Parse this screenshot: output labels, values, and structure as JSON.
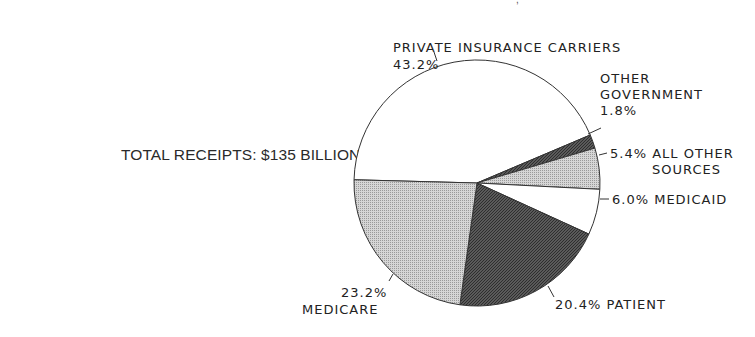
{
  "chart_data": {
    "type": "pie",
    "title": "",
    "annotation": "TOTAL RECEIPTS: $135 BILLION",
    "slices": [
      {
        "name": "PRIVATE INSURANCE CARRIERS",
        "value": 43.2,
        "label": "43.2%",
        "fill": "white"
      },
      {
        "name": "OTHER GOVERNMENT",
        "value": 1.8,
        "label": "1.8%",
        "fill": "dark"
      },
      {
        "name": "ALL OTHER SOURCES",
        "value": 5.4,
        "label": "5.4%",
        "fill": "light"
      },
      {
        "name": "MEDICAID",
        "value": 6.0,
        "label": "6.0%",
        "fill": "white"
      },
      {
        "name": "PATIENT",
        "value": 20.4,
        "label": "20.4%",
        "fill": "dark"
      },
      {
        "name": "MEDICARE",
        "value": 23.2,
        "label": "23.2%",
        "fill": "light"
      }
    ]
  },
  "labels": {
    "total": "TOTAL RECEIPTS: $135 BILLION",
    "private_name": "PRIVATE INSURANCE CARRIERS",
    "private_pct": "43.2%",
    "othergov_line1": "OTHER",
    "othergov_line2": "GOVERNMENT",
    "othergov_pct": "1.8%",
    "allother_line1": "5.4% ALL OTHER",
    "allother_line2": "SOURCES",
    "medicaid": "6.0% MEDICAID",
    "patient": "20.4% PATIENT",
    "medicare_pct": "23.2%",
    "medicare_name": "MEDICARE"
  },
  "colors": {
    "outline": "#333333",
    "dark": "#4a4a4a",
    "light": "#c8c8c8",
    "white": "#ffffff"
  }
}
